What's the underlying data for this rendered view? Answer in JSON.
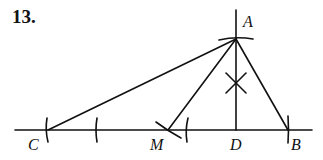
{
  "problem_number": "13.",
  "points": {
    "A": {
      "label": "A",
      "x": 236,
      "y": 39
    },
    "B": {
      "label": "B",
      "x": 288,
      "y": 130
    },
    "C": {
      "label": "C",
      "x": 48,
      "y": 130
    },
    "M": {
      "label": "M",
      "x": 168,
      "y": 130
    },
    "D": {
      "label": "D",
      "x": 236,
      "y": 130
    }
  },
  "colors": {
    "ink": "#111111",
    "background": "#ffffff"
  }
}
